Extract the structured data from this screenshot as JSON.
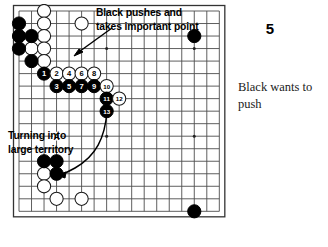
{
  "diagram": {
    "kind": "go-board-problem",
    "board_size": 17,
    "annotations": [
      {
        "id": "top",
        "text": "Black pushes and\ntakes important point"
      },
      {
        "id": "bottom",
        "text": "Turning into\nlarge territory"
      }
    ],
    "point_label": "A",
    "stones": {
      "black_plain": [
        {
          "col": 0,
          "row": 1
        },
        {
          "col": 0,
          "row": 2
        },
        {
          "col": 1,
          "row": 2
        },
        {
          "col": 0,
          "row": 3
        },
        {
          "col": 1,
          "row": 4
        },
        {
          "col": 14,
          "row": 2
        },
        {
          "col": 2,
          "row": 12
        },
        {
          "col": 3,
          "row": 12
        },
        {
          "col": 3,
          "row": 13
        },
        {
          "col": 14,
          "row": 16
        }
      ],
      "white_plain": [
        {
          "col": 2,
          "row": 0
        },
        {
          "col": 2,
          "row": 1
        },
        {
          "col": 5,
          "row": 1
        },
        {
          "col": 2,
          "row": 2
        },
        {
          "col": 1,
          "row": 3
        },
        {
          "col": 2,
          "row": 3
        },
        {
          "col": 2,
          "row": 4
        },
        {
          "col": 2,
          "row": 13
        },
        {
          "col": 2,
          "row": 14
        },
        {
          "col": 3,
          "row": 15
        },
        {
          "col": 5,
          "row": 15
        }
      ]
    },
    "move_sequence": [
      {
        "num": 1,
        "color": "black",
        "col": 2,
        "row": 5
      },
      {
        "num": 2,
        "color": "white",
        "col": 3,
        "row": 5
      },
      {
        "num": 3,
        "color": "black",
        "col": 3,
        "row": 6
      },
      {
        "num": 4,
        "color": "white",
        "col": 4,
        "row": 5
      },
      {
        "num": 5,
        "color": "black",
        "col": 4,
        "row": 6
      },
      {
        "num": 6,
        "color": "white",
        "col": 5,
        "row": 5
      },
      {
        "num": 7,
        "color": "black",
        "col": 5,
        "row": 6
      },
      {
        "num": 8,
        "color": "white",
        "col": 6,
        "row": 5
      },
      {
        "num": 9,
        "color": "black",
        "col": 6,
        "row": 6
      },
      {
        "num": 10,
        "color": "white",
        "col": 7,
        "row": 6
      },
      {
        "num": 11,
        "color": "black",
        "col": 7,
        "row": 7
      },
      {
        "num": 12,
        "color": "white",
        "col": 8,
        "row": 7
      },
      {
        "num": 13,
        "color": "black",
        "col": 7,
        "row": 8
      }
    ],
    "star_points": [
      {
        "col": 7,
        "row": 3
      },
      {
        "col": 14,
        "row": 3
      },
      {
        "col": 7,
        "row": 10
      },
      {
        "col": 14,
        "row": 10
      },
      {
        "col": 3,
        "row": 10
      }
    ],
    "colors": {
      "black_stone": "#000000",
      "white_stone": "#ffffff",
      "grid_line": "#4d4d4d",
      "border_line": "#333333",
      "board_background": "#ffffff",
      "text": "#000000"
    }
  },
  "panel": {
    "number": "5",
    "caption": "Black wants\nto push"
  }
}
